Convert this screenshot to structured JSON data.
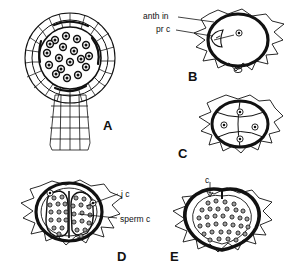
{
  "figure": {
    "kind": "botanical-line-drawing-plate",
    "background_color": "#ffffff",
    "ink_color": "#111111",
    "width": 290,
    "height": 280
  },
  "panels": [
    {
      "id": "A",
      "letter": "A",
      "name": "mature-antheridium-section",
      "description": "Longitudinal section of a stalked antheridium with multilayered cellular jacket, inner mass of dark androcyte cells, and a multicellular stalk below"
    },
    {
      "id": "B",
      "letter": "B",
      "name": "antheridial-initial-stage",
      "description": "Spiky outline cell containing a thick-walled oval antheridial initial with a single nucleus"
    },
    {
      "id": "C",
      "letter": "C",
      "name": "quadrant-stage",
      "description": "Spiky cell enclosing an oval divided into four quadrant cells, each with a nucleus"
    },
    {
      "id": "D",
      "letter": "D",
      "name": "sperm-mass-two-lobed-stage",
      "description": "Spiky cell enclosing a thick jacket with a two-lobed mass of developing sperm cells"
    },
    {
      "id": "E",
      "letter": "E",
      "name": "mature-sperm-mass-stage",
      "description": "Spiky cell enclosing a thick dark jacket filled with a dense mass of mature sperm cells"
    }
  ],
  "labels": [
    {
      "id": "anth-in",
      "text": "anth in",
      "panel": "B",
      "meaning": "antheridial initial"
    },
    {
      "id": "pr-c",
      "text": "pr c",
      "panel": "B",
      "meaning": "primary cell"
    },
    {
      "id": "j-c",
      "text": "j c",
      "panel": "D",
      "meaning": "jacket cell"
    },
    {
      "id": "sperm-c",
      "text": "sperm c",
      "panel": "D",
      "meaning": "sperm cell"
    },
    {
      "id": "c-e",
      "text": "c",
      "panel": "E",
      "meaning": "cell"
    }
  ]
}
